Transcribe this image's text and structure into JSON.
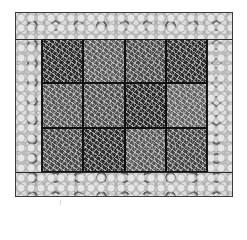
{
  "figure": {
    "outer_frame": {
      "texture": "spherical-particles",
      "color": "#c8c8c8"
    },
    "grid": {
      "rows": 3,
      "columns": 4,
      "texture": "fibrous-strands",
      "tiles": [
        {
          "row": 1,
          "col": 1,
          "shade": "dark",
          "color": "#2b2b2b"
        },
        {
          "row": 1,
          "col": 2,
          "shade": "medium",
          "color": "#5a5a5a"
        },
        {
          "row": 1,
          "col": 3,
          "shade": "medium-dark",
          "color": "#4a4a4a"
        },
        {
          "row": 1,
          "col": 4,
          "shade": "dark",
          "color": "#2e2e2e"
        },
        {
          "row": 2,
          "col": 1,
          "shade": "medium",
          "color": "#555555"
        },
        {
          "row": 2,
          "col": 2,
          "shade": "medium",
          "color": "#505050"
        },
        {
          "row": 2,
          "col": 3,
          "shade": "dark",
          "color": "#2a2a2a"
        },
        {
          "row": 2,
          "col": 4,
          "shade": "medium-light",
          "color": "#636363"
        },
        {
          "row": 3,
          "col": 1,
          "shade": "medium-dark",
          "color": "#474747"
        },
        {
          "row": 3,
          "col": 2,
          "shade": "dark",
          "color": "#2c2c2c"
        },
        {
          "row": 3,
          "col": 3,
          "shade": "medium",
          "color": "#575757"
        },
        {
          "row": 3,
          "col": 4,
          "shade": "medium-dark",
          "color": "#444444"
        }
      ]
    }
  }
}
